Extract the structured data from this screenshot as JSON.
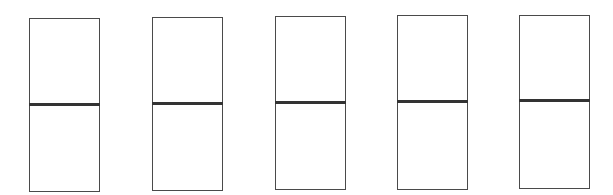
{
  "diagram": {
    "canvas": {
      "width": 613,
      "height": 195,
      "background": "#ffffff"
    },
    "stroke_color": "#4a4a4a",
    "divider_color": "#333333",
    "boxes": [
      {
        "id": 1,
        "x": 29,
        "top": 18,
        "mid": 104,
        "bottom": 192,
        "width": 71
      },
      {
        "id": 2,
        "x": 152,
        "top": 17,
        "mid": 103,
        "bottom": 191,
        "width": 71
      },
      {
        "id": 3,
        "x": 275,
        "top": 16,
        "mid": 102,
        "bottom": 190,
        "width": 71
      },
      {
        "id": 4,
        "x": 397,
        "top": 15,
        "mid": 101,
        "bottom": 190,
        "width": 71
      },
      {
        "id": 5,
        "x": 519,
        "top": 15,
        "mid": 100,
        "bottom": 189,
        "width": 71
      }
    ]
  }
}
